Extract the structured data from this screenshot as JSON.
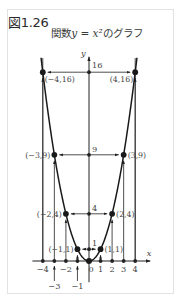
{
  "figure": {
    "label": "図1.26",
    "title_prefix": "関数",
    "title_math": "y = x²",
    "title_suffix": "のグラフ"
  },
  "colors": {
    "curve": "#1a1a1a",
    "axis": "#222222",
    "text": "#444444",
    "frame": "#e2e2e2"
  },
  "chart_data": {
    "type": "line",
    "xlabel": "x",
    "ylabel": "y",
    "function": "y = x^2",
    "x_ticks": [
      -4,
      -3,
      -2,
      -1,
      0,
      1,
      2,
      3,
      4
    ],
    "x_tick_labels": [
      "-4",
      "-3",
      "-2",
      "-1",
      "0",
      "1",
      "2",
      "3",
      "4"
    ],
    "y_ticks": [
      1,
      4,
      9,
      16
    ],
    "y_tick_labels": [
      "1",
      "4",
      "9",
      "16"
    ],
    "xlim": [
      -4.9,
      5.3
    ],
    "ylim": [
      -1.8,
      17.3
    ],
    "grid": false,
    "legend": null,
    "series": [
      {
        "name": "y = x^2",
        "x": [
          -4.15,
          -4,
          -3,
          -2,
          -1,
          0,
          1,
          2,
          3,
          4,
          4.15
        ],
        "y": [
          17.22,
          16,
          9,
          4,
          1,
          0,
          1,
          4,
          9,
          16,
          17.22
        ]
      }
    ],
    "points": [
      {
        "x": -4,
        "y": 16,
        "label": "(−4,16)"
      },
      {
        "x": 4,
        "y": 16,
        "label": "(4,16)"
      },
      {
        "x": -3,
        "y": 9,
        "label": "(−3,9)"
      },
      {
        "x": 3,
        "y": 9,
        "label": "(3,9)"
      },
      {
        "x": -2,
        "y": 4,
        "label": "(−2,4)"
      },
      {
        "x": 2,
        "y": 4,
        "label": "(2,4)"
      },
      {
        "x": -1,
        "y": 1,
        "label": "(−1,1)"
      },
      {
        "x": 1,
        "y": 1,
        "label": "(1,1)"
      },
      {
        "x": 0,
        "y": 0,
        "label": ""
      }
    ],
    "annotations": [
      "vertical arrows from x-axis at x = ±1, ±2, ±3, ±4 up to the curve",
      "horizontal arrows from y-axis at y = 1, 4, 9, 16 out to both points"
    ]
  }
}
